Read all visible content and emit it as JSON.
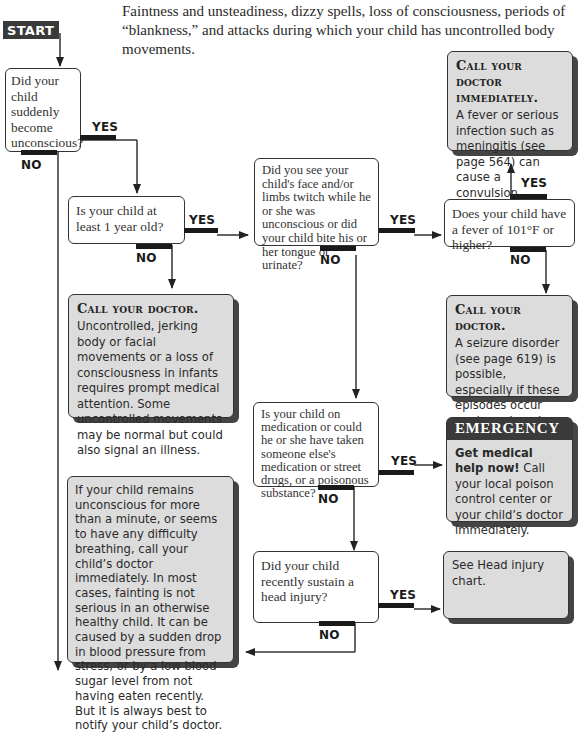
{
  "intro": "Faintness and unsteadiness, dizzy spells, loss of consciousness, periods of “blankness,” and attacks during which your child has uncontrolled body movements.",
  "start_label": "START",
  "labels": {
    "yes": "YES",
    "no": "NO"
  },
  "questions": [
    {
      "id": "q1",
      "text": "Did your child suddenly become unconscious?"
    },
    {
      "id": "q2",
      "text": "Is your child at least 1 year old?"
    },
    {
      "id": "q3",
      "text": "Did you see your child's face and/or limbs twitch while he or she was unconscious or did your child bite his or her tongue or urinate?"
    },
    {
      "id": "q4",
      "text": "Does your child have a fever of 101°F or higher?"
    },
    {
      "id": "q5",
      "text": "Is your child on medication or could he or she have taken someone else's medication or street drugs, or a poisonous substance?"
    },
    {
      "id": "q6",
      "text": "Did your child recently sustain a head injury?"
    }
  ],
  "outcomes": {
    "call_immediately": {
      "heading": "Call your doctor immediately.",
      "body": "A fever or serious infection such as meningitis (see page 564) can cause a convulsion."
    },
    "call_infant": {
      "heading": "Call your doctor.",
      "body": "Uncontrolled, jerking body or facial movements or a loss of consciousness in infants requires prompt medical attention. Some uncontrolled movements may be normal but could also signal an illness."
    },
    "call_seizure": {
      "heading": "Call your doctor.",
      "body": "A seizure disorder (see page 619) is possible, especially if these episodes occur again and again."
    },
    "emergency": {
      "banner": "EMERGENCY",
      "bold": "Get medical help now!",
      "body": "Call your local poison control center or your child’s doctor immediately."
    },
    "head_injury": {
      "body": "See Head injury chart."
    },
    "fainting": {
      "body": "If your child remains unconscious for more than a minute, or seems to have any difficulty breathing, call your child’s doctor immediately. In most cases, fainting is not serious in an otherwise healthy child. It can be caused by a sudden drop in blood pressure from stress, or by a low blood sugar level from not having eaten recently. But it is always best to notify your child’s doctor."
    }
  },
  "colors": {
    "answer_box": "#dcdcdc",
    "dark": "#3a3a3a",
    "line": "#333333"
  }
}
